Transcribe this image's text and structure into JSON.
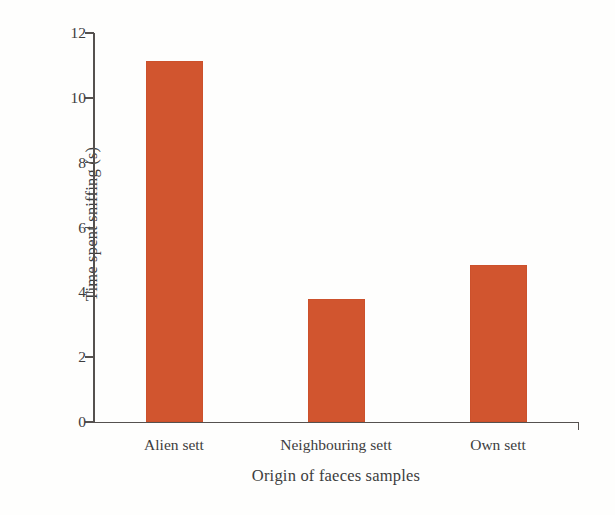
{
  "chart_data": {
    "type": "bar",
    "title": "",
    "subtitle": "",
    "categories": [
      "Alien sett",
      "Neighbouring sett",
      "Own sett"
    ],
    "values": [
      11.15,
      3.8,
      4.85
    ],
    "xlabel": "Origin of faeces samples",
    "ylabel": "Time spent sniffing (s)",
    "ylim": [
      0,
      12
    ],
    "yticks": [
      0,
      2,
      4,
      6,
      8,
      10,
      12
    ],
    "ytick_labels": [
      "0",
      "2",
      "4",
      "6",
      "8",
      "10",
      "12"
    ],
    "grid": false,
    "legend": false,
    "legend_position": "none",
    "bar_color": "#d1552f",
    "axis_color": "#55514f",
    "background_color": "#fefefd",
    "annotations": []
  },
  "axes": {
    "y_axis_label": "Time spent sniffing (s)",
    "x_axis_label": "Origin of faeces samples"
  }
}
